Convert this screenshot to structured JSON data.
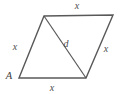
{
  "figure": {
    "type": "geometry-diagram",
    "shape": "rhombus-with-diagonal",
    "background_color": "#ffffff",
    "stroke_color": "#595959",
    "stroke_width": 1.4,
    "label_color": "#4d4d4d",
    "vertices": {
      "A": {
        "x": 19,
        "y": 78
      },
      "B": {
        "x": 44,
        "y": 16
      },
      "C": {
        "x": 113,
        "y": 15
      },
      "D": {
        "x": 86,
        "y": 78
      }
    },
    "edges": [
      {
        "name": "top-edge",
        "from": "B",
        "to": "C"
      },
      {
        "name": "right-edge",
        "from": "C",
        "to": "D"
      },
      {
        "name": "bottom-edge",
        "from": "D",
        "to": "A"
      },
      {
        "name": "left-edge",
        "from": "A",
        "to": "B"
      }
    ],
    "diagonal": {
      "name": "diagonal",
      "from": "B",
      "to": "D"
    },
    "labels": {
      "top_side": {
        "text": "x",
        "x": 77,
        "y": 6
      },
      "left_side": {
        "text": "x",
        "x": 15,
        "y": 47
      },
      "right_side": {
        "text": "x",
        "x": 106,
        "y": 49
      },
      "bottom_side": {
        "text": "x",
        "x": 52,
        "y": 88
      },
      "diagonal": {
        "text": "d",
        "x": 66,
        "y": 44
      },
      "vertex_a": {
        "text": "A",
        "x": 9,
        "y": 76
      }
    }
  }
}
